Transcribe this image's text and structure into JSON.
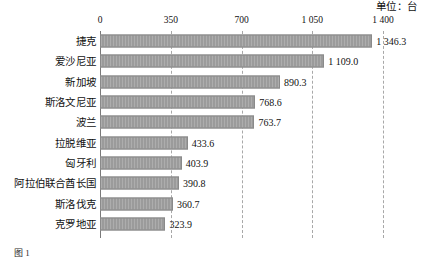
{
  "unit_note": "单位：台",
  "figure_caption": "图 1",
  "axis": {
    "tick_labels": [
      "0",
      "350",
      "700",
      "1 050",
      "1 400"
    ],
    "tick_values": [
      0,
      350,
      700,
      1050,
      1400
    ]
  },
  "colors": {
    "bar_fill": "#9b9b9b",
    "bar_border": "#8a8a8a",
    "gridline": "#a8a8a8",
    "axis_line": "#7a7a7a",
    "text": "#111111",
    "background": "#ffffff"
  },
  "chart_data": {
    "type": "bar",
    "orientation": "horizontal",
    "title": "",
    "subtitle": "",
    "xlabel": "",
    "ylabel": "",
    "unit": "单位：台",
    "xlim": [
      0,
      1400
    ],
    "grid": true,
    "grid_axis": "x",
    "legend": false,
    "legend_position": "none",
    "categories": [
      "捷克",
      "爱沙尼亚",
      "新加坡",
      "斯洛文尼亚",
      "波兰",
      "拉脱维亚",
      "匈牙利",
      "阿拉伯联合酋长国",
      "斯洛伐克",
      "克罗地亚"
    ],
    "values": [
      1346.3,
      1109.0,
      890.3,
      768.6,
      763.7,
      433.6,
      403.9,
      390.8,
      360.7,
      323.9
    ],
    "value_labels": [
      "1 346.3",
      "1 109.0",
      "890.3",
      "768.6",
      "763.7",
      "433.6",
      "403.9",
      "390.8",
      "360.7",
      "323.9"
    ]
  }
}
